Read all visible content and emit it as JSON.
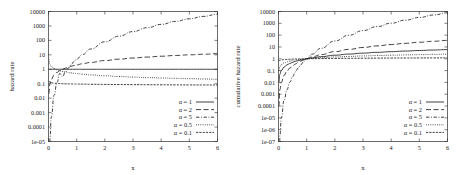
{
  "figure": {
    "panels": [
      {
        "id": "hazard-rate",
        "ylabel": "hazard rate",
        "xlabel": "x"
      },
      {
        "id": "cumulative-hazard-rate",
        "ylabel": "cumulative hazard rate",
        "xlabel": "x"
      }
    ]
  },
  "left": {
    "ylabel": "hazard rate",
    "xlabel": "x",
    "xticks": [
      "0",
      "1",
      "2",
      "3",
      "4",
      "5",
      "6"
    ],
    "yticks": [
      "10000",
      "1000",
      "100",
      "10",
      "1",
      "0.1",
      "0.01",
      "0.001",
      "0.0001",
      "1e-05"
    ],
    "legend": [
      {
        "label": "α = 1",
        "style": "solid"
      },
      {
        "label": "α = 2",
        "style": "longdash"
      },
      {
        "label": "α = 5",
        "style": "dashdot"
      },
      {
        "label": "α = 0.5",
        "style": "dotted"
      },
      {
        "label": "α = 0.1",
        "style": "finedash"
      }
    ]
  },
  "right": {
    "ylabel": "cumulative hazard rate",
    "xlabel": "x",
    "xticks": [
      "0",
      "1",
      "2",
      "3",
      "4",
      "5",
      "6"
    ],
    "yticks": [
      "10000",
      "1000",
      "100",
      "10",
      "1",
      "0.1",
      "0.01",
      "0.001",
      "0.0001",
      "1e-05",
      "1e-06",
      "1e-07"
    ],
    "legend": [
      {
        "label": "α = 1",
        "style": "solid"
      },
      {
        "label": "α = 2",
        "style": "longdash"
      },
      {
        "label": "α = 5",
        "style": "dashdot"
      },
      {
        "label": "α = 0.5",
        "style": "dotted"
      },
      {
        "label": "α = 0.1",
        "style": "finedash"
      }
    ]
  },
  "chart_data": [
    {
      "type": "line",
      "title": "",
      "xlabel": "x",
      "ylabel": "hazard rate",
      "xlim": [
        0,
        6
      ],
      "ylim": [
        1e-05,
        10000
      ],
      "yscale": "log",
      "xscale": "linear",
      "grid": false,
      "legend_position": "bottom-right",
      "xticks": [
        0,
        1,
        2,
        3,
        4,
        5,
        6
      ],
      "yticks": [
        10000,
        1000,
        100,
        10,
        1,
        0.1,
        0.01,
        0.001,
        0.0001,
        1e-05
      ],
      "x": [
        0.01,
        0.05,
        0.1,
        0.2,
        0.3,
        0.4,
        0.5,
        0.6,
        0.7,
        0.8,
        0.9,
        1.0,
        1.2,
        1.5,
        2.0,
        2.5,
        3.0,
        3.5,
        4.0,
        4.5,
        5.0,
        5.5,
        6.0
      ],
      "series": [
        {
          "name": "α = 1",
          "style": "solid",
          "values": [
            1,
            1,
            1,
            1,
            1,
            1,
            1,
            1,
            1,
            1,
            1,
            1,
            1,
            1,
            1,
            1,
            1,
            1,
            1,
            1,
            1,
            1,
            1
          ]
        },
        {
          "name": "α = 2",
          "style": "longdash",
          "values": [
            0.02,
            0.1,
            0.2,
            0.4,
            0.6,
            0.8,
            1.0,
            1.2,
            1.4,
            1.6,
            1.8,
            2.0,
            2.4,
            3.0,
            4.0,
            5.0,
            6.0,
            7.0,
            8.0,
            9.0,
            10.0,
            11.0,
            12.0
          ]
        },
        {
          "name": "α = 5",
          "style": "dashdot",
          "values": [
            5e-09,
            1.56e-05,
            0.0005,
            0.016,
            0.12,
            0.512,
            0.3125,
            0.648,
            1.2005,
            2.048,
            3.28,
            5.0,
            10.37,
            25.3,
            80.0,
            195.3,
            405.0,
            750.6,
            1280.0,
            2050.3,
            3125.0,
            4573.8,
            6480.0
          ]
        },
        {
          "name": "α = 0.5",
          "style": "dotted",
          "values": [
            5.0,
            2.24,
            1.58,
            1.12,
            0.91,
            0.79,
            0.707,
            0.645,
            0.598,
            0.559,
            0.527,
            0.5,
            0.456,
            0.408,
            0.354,
            0.316,
            0.289,
            0.267,
            0.25,
            0.236,
            0.224,
            0.213,
            0.204
          ]
        },
        {
          "name": "α = 0.1",
          "style": "finedash",
          "values": [
            0.158,
            0.126,
            0.117,
            0.109,
            0.105,
            0.102,
            0.1,
            0.0986,
            0.0975,
            0.0965,
            0.0957,
            0.095,
            0.0935,
            0.0919,
            0.0896,
            0.0878,
            0.0864,
            0.0852,
            0.0842,
            0.0833,
            0.0825,
            0.0818,
            0.0812
          ]
        }
      ]
    },
    {
      "type": "line",
      "title": "",
      "xlabel": "x",
      "ylabel": "cumulative hazard rate",
      "xlim": [
        0,
        6
      ],
      "ylim": [
        1e-07,
        10000
      ],
      "yscale": "log",
      "xscale": "linear",
      "grid": false,
      "legend_position": "bottom-right",
      "xticks": [
        0,
        1,
        2,
        3,
        4,
        5,
        6
      ],
      "yticks": [
        10000,
        1000,
        100,
        10,
        1,
        0.1,
        0.01,
        0.001,
        0.0001,
        1e-05,
        1e-06,
        1e-07
      ],
      "x": [
        0.01,
        0.05,
        0.1,
        0.2,
        0.3,
        0.4,
        0.5,
        0.6,
        0.7,
        0.8,
        0.9,
        1.0,
        1.2,
        1.5,
        2.0,
        2.5,
        3.0,
        3.5,
        4.0,
        4.5,
        5.0,
        5.5,
        6.0
      ],
      "series": [
        {
          "name": "α = 1",
          "style": "solid",
          "values": [
            0.01,
            0.05,
            0.1,
            0.2,
            0.3,
            0.4,
            0.5,
            0.6,
            0.7,
            0.8,
            0.9,
            1.0,
            1.2,
            1.5,
            2.0,
            2.5,
            3.0,
            3.5,
            4.0,
            4.5,
            5.0,
            5.5,
            6.0
          ]
        },
        {
          "name": "α = 2",
          "style": "longdash",
          "values": [
            0.0001,
            0.0025,
            0.01,
            0.04,
            0.09,
            0.16,
            0.25,
            0.36,
            0.49,
            0.64,
            0.81,
            1.0,
            1.44,
            2.25,
            4.0,
            6.25,
            9.0,
            12.25,
            16.0,
            20.25,
            25.0,
            30.25,
            36.0
          ]
        },
        {
          "name": "α = 5",
          "style": "dashdot",
          "values": [
            1e-10,
            3.1e-07,
            1e-05,
            0.00032,
            0.0024,
            0.0102,
            0.031,
            0.0778,
            0.168,
            0.328,
            0.59,
            1.0,
            2.49,
            7.59,
            32.0,
            97.66,
            243.0,
            525.2,
            1024.0,
            1845.3,
            3125.0,
            5032.8,
            7776.0
          ]
        },
        {
          "name": "α = 0.5",
          "style": "dotted",
          "values": [
            0.1,
            0.224,
            0.316,
            0.447,
            0.548,
            0.632,
            0.707,
            0.775,
            0.837,
            0.894,
            0.949,
            1.0,
            1.095,
            1.225,
            1.414,
            1.581,
            1.732,
            1.871,
            2.0,
            2.121,
            2.236,
            2.345,
            2.449
          ]
        },
        {
          "name": "α = 0.1",
          "style": "finedash",
          "values": [
            0.631,
            0.741,
            0.794,
            0.851,
            0.887,
            0.912,
            0.933,
            0.95,
            0.965,
            0.978,
            0.99,
            1.0,
            1.018,
            1.041,
            1.072,
            1.096,
            1.116,
            1.133,
            1.149,
            1.162,
            1.175,
            1.186,
            1.196
          ]
        }
      ]
    }
  ]
}
